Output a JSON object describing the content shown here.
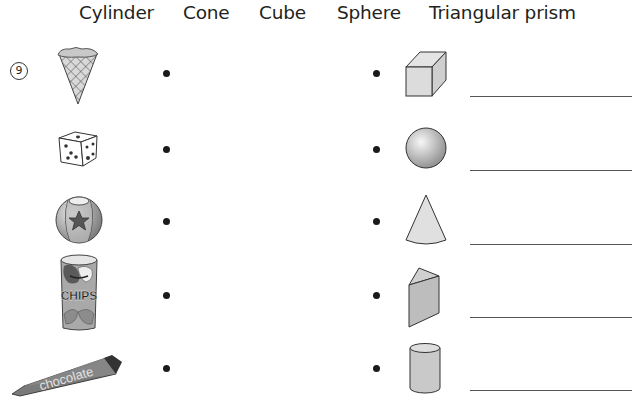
{
  "header": {
    "labels": [
      "Cylinder",
      "Cone",
      "Cube",
      "Sphere",
      "Triangular prism"
    ]
  },
  "problem_number": "9",
  "rows": [
    {
      "object": "ice-cream-cone",
      "shape": "cube",
      "answer": ""
    },
    {
      "object": "die",
      "shape": "sphere",
      "answer": ""
    },
    {
      "object": "beach-ball",
      "shape": "cone",
      "answer": ""
    },
    {
      "object": "chips-can",
      "shape": "triangular-prism",
      "answer": ""
    },
    {
      "object": "chocolate-bar",
      "shape": "cylinder",
      "answer": ""
    }
  ],
  "object_text": {
    "chips_label": "CHIPS",
    "chocolate_label": "chocolate"
  }
}
